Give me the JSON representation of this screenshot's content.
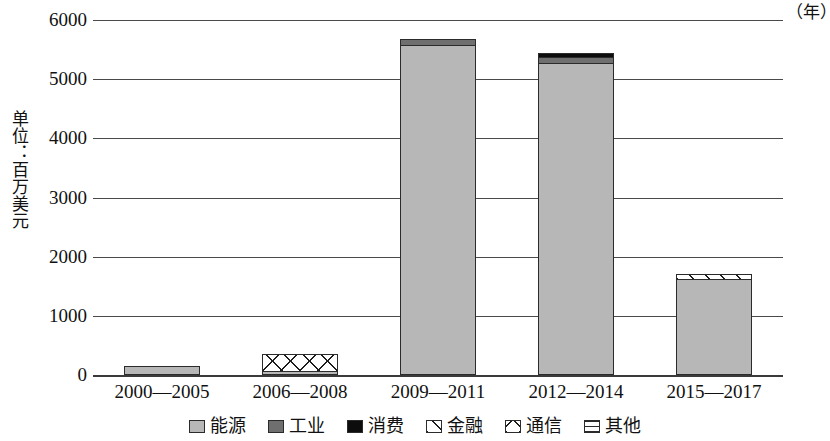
{
  "chart_data": {
    "type": "bar",
    "subtype": "stacked-bar",
    "title": "",
    "xlabel": "年",
    "ylabel": "单位：百万美元",
    "ylim": [
      0,
      6000
    ],
    "ytick_step": 1000,
    "yticks": [
      "6000",
      "5000",
      "4000",
      "3000",
      "2000",
      "1000",
      "0"
    ],
    "grid": true,
    "legend_position": "bottom",
    "categories": [
      "2000—2005",
      "2006—2008",
      "2009—2011",
      "2012—2014",
      "2015—2017"
    ],
    "series": [
      {
        "name": "能源",
        "pattern": "solid-light-gray",
        "color": "#b7b7b7",
        "values": [
          150,
          60,
          5580,
          5280,
          1620
        ]
      },
      {
        "name": "工业",
        "pattern": "solid-dark-gray",
        "color": "#6f6f6f",
        "values": [
          0,
          0,
          100,
          100,
          0
        ]
      },
      {
        "name": "消费",
        "pattern": "solid-black",
        "color": "#0d0d0d",
        "values": [
          0,
          0,
          0,
          60,
          0
        ]
      },
      {
        "name": "金融",
        "pattern": "diagonal-hatch",
        "color": "#ffffff",
        "values": [
          0,
          0,
          0,
          0,
          90
        ]
      },
      {
        "name": "通信",
        "pattern": "cross-hatch",
        "color": "#ffffff",
        "values": [
          0,
          290,
          0,
          0,
          0
        ]
      },
      {
        "name": "其他",
        "pattern": "horizontal-lines",
        "color": "#ffffff",
        "values": [
          0,
          0,
          0,
          0,
          0
        ]
      }
    ],
    "totals": [
      150,
      350,
      5680,
      5440,
      1710
    ]
  },
  "axis": {
    "y_title": "单位：百万美元",
    "x_unit": "（年）",
    "ticks": [
      {
        "label": "6000",
        "value": 6000
      },
      {
        "label": "5000",
        "value": 5000
      },
      {
        "label": "4000",
        "value": 4000
      },
      {
        "label": "3000",
        "value": 3000
      },
      {
        "label": "2000",
        "value": 2000
      },
      {
        "label": "1000",
        "value": 1000
      },
      {
        "label": "0",
        "value": 0
      }
    ]
  },
  "categories": [
    {
      "label": "2000—2005"
    },
    {
      "label": "2006—2008"
    },
    {
      "label": "2009—2011"
    },
    {
      "label": "2012—2014"
    },
    {
      "label": "2015—2017"
    }
  ],
  "legend": {
    "items": [
      {
        "label": "能源",
        "swatch": "solid-light-gray"
      },
      {
        "label": "工业",
        "swatch": "solid-dark-gray"
      },
      {
        "label": "消费",
        "swatch": "solid-black"
      },
      {
        "label": "金融",
        "swatch": "diagonal-hatch"
      },
      {
        "label": "通信",
        "swatch": "cross-hatch"
      },
      {
        "label": "其他",
        "swatch": "horizontal-lines"
      }
    ]
  }
}
